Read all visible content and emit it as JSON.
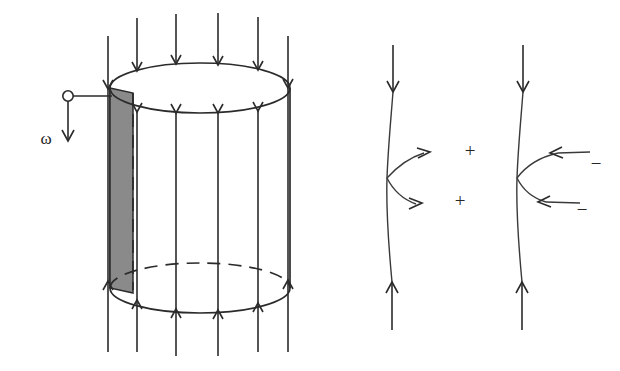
{
  "figure": {
    "background_color": "#ffffff",
    "ink_color": "#2b2b2b",
    "shading_color": "#8a8a8a"
  },
  "left_panel": {
    "name": "rotating-cylinder-with-field-lines",
    "angular_velocity_label": "ω",
    "cylinder": {
      "top_ellipse_center": [
        200,
        88
      ],
      "bottom_ellipse_center": [
        200,
        288
      ],
      "radius_x": 90,
      "radius_y": 25,
      "left_wall_x": 110,
      "right_wall_x": 290
    },
    "shaded_band": {
      "label": "shaded-strip",
      "x_start": 110,
      "x_end": 133,
      "y_top": 88,
      "y_bottom": 288,
      "color": "#8a8a8a"
    },
    "field_lines": {
      "direction": "downward",
      "count": 6,
      "x_positions": [
        108,
        137,
        176,
        218,
        258,
        288
      ],
      "top_y": 18,
      "bottom_y": 352,
      "top_arrow_label": "down-arrow",
      "bottom_arrow_label": "up-arrow"
    },
    "leader": {
      "circle_center": [
        68,
        96
      ],
      "circle_radius": 5,
      "line_to_x": 112,
      "arrow_bottom_y": 141
    }
  },
  "right_panel": {
    "name": "charge-separation-field-lines",
    "lines": [
      {
        "name": "field-line-positive",
        "x": 393,
        "top_y": 45,
        "bottom_y": 330,
        "branch_direction": "outward",
        "charge_sign": "+",
        "charge_labels": [
          "+",
          "+"
        ]
      },
      {
        "name": "field-line-negative",
        "x": 523,
        "top_y": 45,
        "bottom_y": 330,
        "branch_direction": "inward",
        "charge_sign": "−",
        "charge_labels": [
          "−",
          "−"
        ]
      }
    ],
    "positive_signs": [
      {
        "text": "+",
        "x": 470,
        "y": 155
      },
      {
        "text": "+",
        "x": 460,
        "y": 204
      }
    ],
    "negative_signs": [
      {
        "text": "−",
        "x": 596,
        "y": 166
      },
      {
        "text": "−",
        "x": 582,
        "y": 212
      }
    ]
  }
}
